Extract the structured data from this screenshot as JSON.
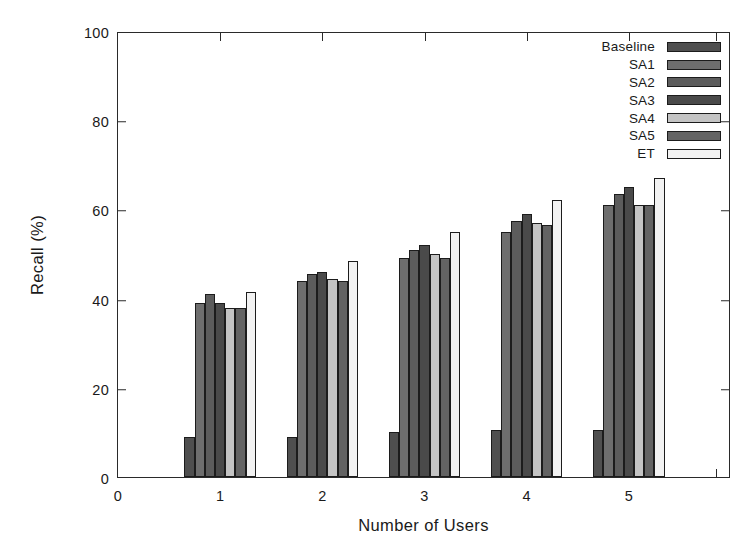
{
  "chart_data": {
    "type": "bar",
    "title": "",
    "xlabel": "Number of Users",
    "ylabel": "Recall (%)",
    "categories": [
      "1",
      "2",
      "3",
      "4",
      "5"
    ],
    "xlim": [
      0,
      6
    ],
    "ylim": [
      0,
      100
    ],
    "xticks": [
      "0",
      "1",
      "2",
      "3",
      "4",
      "5"
    ],
    "yticks": [
      "0",
      "20",
      "40",
      "60",
      "80",
      "100"
    ],
    "grid": false,
    "legend_position": "top-right",
    "series": [
      {
        "name": "Baseline",
        "color": "#4f4f4f",
        "values": [
          9,
          9,
          10,
          10.5,
          10.5
        ]
      },
      {
        "name": "SA1",
        "color": "#6e6e6e",
        "values": [
          39,
          44,
          49,
          55,
          61
        ]
      },
      {
        "name": "SA2",
        "color": "#5c5c5c",
        "values": [
          41,
          45.5,
          51,
          57.5,
          63.5
        ]
      },
      {
        "name": "SA3",
        "color": "#4a4a4a",
        "values": [
          39,
          46,
          52,
          59,
          65
        ]
      },
      {
        "name": "SA4",
        "color": "#c4c4c4",
        "values": [
          38,
          44.5,
          50,
          57,
          61
        ]
      },
      {
        "name": "SA5",
        "color": "#636363",
        "values": [
          38,
          44,
          49,
          56.5,
          61
        ]
      },
      {
        "name": "ET",
        "color": "#f2f2f2",
        "values": [
          41.5,
          48.5,
          55,
          62,
          67
        ]
      }
    ]
  }
}
